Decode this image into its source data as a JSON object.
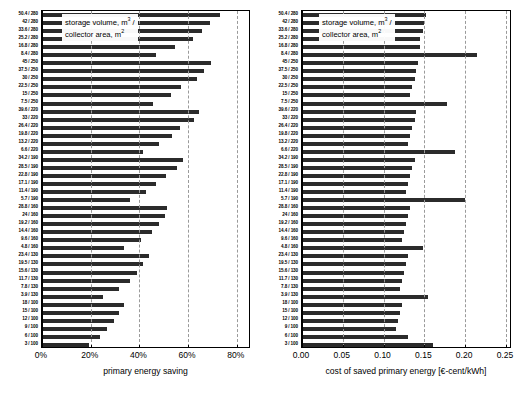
{
  "chart_data": [
    {
      "type": "bar",
      "id": "primary-energy-saving",
      "orientation": "horizontal",
      "title": "",
      "xlabel": "primary energy saving",
      "ylabel": "storage volume, m3 / collector area, m2",
      "legend_text_line1": "storage volume, m",
      "legend_sup1": "3",
      "legend_text_line1_tail": " /",
      "legend_text_line2": "collector area, m",
      "legend_sup2": "2",
      "xlim": [
        0,
        85
      ],
      "xticks": [
        0,
        20,
        40,
        60,
        80
      ],
      "xticklabels": [
        "0%",
        "20%",
        "40%",
        "60%",
        "80%"
      ],
      "grid": true,
      "unit": "%",
      "categories": [
        "50.4 / 280",
        "42 / 280",
        "33.6 / 280",
        "25.2 / 280",
        "16.8 / 280",
        "8.4 / 280",
        "45 / 250",
        "37.5 / 250",
        "30 / 250",
        "22.5 / 250",
        "15 / 250",
        "7.5 / 250",
        "39.6 / 220",
        "33 / 220",
        "26.4 / 220",
        "19.8 / 220",
        "13.2 / 220",
        "6.6 / 220",
        "34.2 / 190",
        "28.5 / 190",
        "22.8 / 190",
        "17.1 / 190",
        "11.4 / 190",
        "5.7 / 190",
        "28.8 / 160",
        "24 / 160",
        "19.2 / 160",
        "14.4 / 160",
        "9.6 / 160",
        "4.8 / 160",
        "23.4 / 130",
        "19.5 / 130",
        "15.6 / 130",
        "11.7 / 130",
        "7.8 / 130",
        "3.9 / 130",
        "18 / 100",
        "15 / 100",
        "12 / 100",
        "9 / 100",
        "6 / 100",
        "3 / 100"
      ],
      "values": [
        73.0,
        69.0,
        65.5,
        62.0,
        54.5,
        47.0,
        69.5,
        66.5,
        63.5,
        57.0,
        53.0,
        45.5,
        64.5,
        62.5,
        56.5,
        53.5,
        48.0,
        41.5,
        58.0,
        55.5,
        51.0,
        47.0,
        42.5,
        36.0,
        51.5,
        50.5,
        48.0,
        45.0,
        40.5,
        33.5,
        44.0,
        41.5,
        39.0,
        36.0,
        31.5,
        25.0,
        33.5,
        31.5,
        29.5,
        26.5,
        24.0,
        19.5
      ]
    },
    {
      "type": "bar",
      "id": "cost-of-saved-primary-energy",
      "orientation": "horizontal",
      "title": "",
      "xlabel": "cost of saved primary energy [€-cent/kWh]",
      "ylabel": "storage volume, m3 / collector area, m2",
      "legend_text_line1": "storage volume, m",
      "legend_sup1": "3",
      "legend_text_line1_tail": " /",
      "legend_text_line2": "collector area, m",
      "legend_sup2": "2",
      "xlim": [
        0,
        0.255
      ],
      "xticks": [
        0,
        0.05,
        0.1,
        0.15,
        0.2,
        0.25
      ],
      "xticklabels": [
        "0.00",
        "0.05",
        "0.10",
        "0.15",
        "0.20",
        "0.25"
      ],
      "grid": true,
      "unit": "€-cent/kWh",
      "categories": [
        "50.4 / 280",
        "42 / 280",
        "33.6 / 280",
        "25.2 / 280",
        "16.8 / 280",
        "8.4 / 280",
        "45 / 250",
        "37.5 / 250",
        "30 / 250",
        "22.5 / 250",
        "15 / 250",
        "7.5 / 250",
        "39.6 / 220",
        "33 / 220",
        "26.4 / 220",
        "19.8 / 220",
        "13.2 / 220",
        "6.6 / 220",
        "34.2 / 190",
        "28.5 / 190",
        "22.8 / 190",
        "17.1 / 190",
        "11.4 / 190",
        "5.7 / 190",
        "28.8 / 160",
        "24 / 160",
        "19.2 / 160",
        "14.4 / 160",
        "9.6 / 160",
        "4.8 / 160",
        "23.4 / 130",
        "19.5 / 130",
        "15.6 / 130",
        "11.7 / 130",
        "7.8 / 130",
        "3.9 / 130",
        "18 / 100",
        "15 / 100",
        "12 / 100",
        "9 / 100",
        "6 / 100",
        "3 / 100"
      ],
      "values": [
        0.152,
        0.15,
        0.148,
        0.145,
        0.145,
        0.215,
        0.142,
        0.14,
        0.138,
        0.135,
        0.133,
        0.178,
        0.14,
        0.138,
        0.135,
        0.132,
        0.13,
        0.188,
        0.138,
        0.135,
        0.133,
        0.13,
        0.128,
        0.2,
        0.132,
        0.13,
        0.128,
        0.125,
        0.122,
        0.148,
        0.13,
        0.128,
        0.125,
        0.122,
        0.12,
        0.155,
        0.122,
        0.12,
        0.118,
        0.115,
        0.13,
        0.16
      ]
    }
  ]
}
